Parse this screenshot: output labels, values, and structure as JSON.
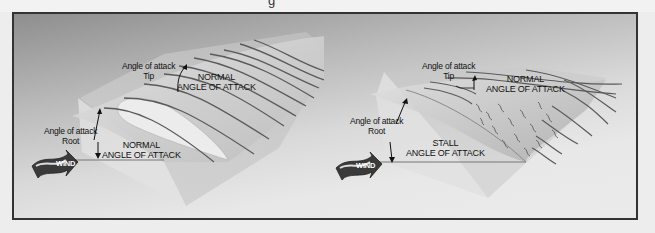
{
  "figure": {
    "top_fragment": "g",
    "panels": [
      {
        "id": "normal",
        "tip_label": {
          "line1": "Angle of attack",
          "line2": "Tip"
        },
        "tip_state": {
          "line1": "NORMAL",
          "line2": "ANGLE OF ATTACK"
        },
        "root_label": {
          "line1": "Angle of attack",
          "line2": "Root"
        },
        "root_state": {
          "line1": "NORMAL",
          "line2": "ANGLE OF ATTACK"
        },
        "wind_label": "WIND"
      },
      {
        "id": "stall",
        "tip_label": {
          "line1": "Angle of attack",
          "line2": "Tip"
        },
        "tip_state": {
          "line1": "NORMAL",
          "line2": "ANGLE OF ATTACK"
        },
        "root_label": {
          "line1": "Angle of attack",
          "line2": "Root"
        },
        "root_state": {
          "line1": "STALL",
          "line2": "ANGLE OF ATTACK"
        },
        "wind_label": "WIND"
      }
    ],
    "colors": {
      "frame_border": "#333333",
      "streamline": "#5a5a5a",
      "wing": "#d6d6d6",
      "plane": "#c4c4c4"
    }
  }
}
